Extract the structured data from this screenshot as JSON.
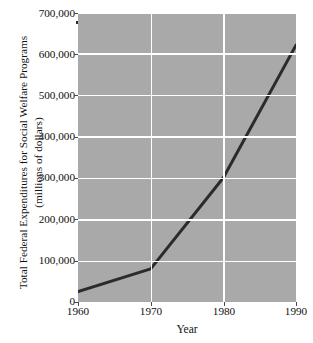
{
  "chart_data": {
    "type": "line",
    "title": "",
    "xlabel": "Year",
    "ylabel": "Total Federal Expenditures for Social Welfare Programs (millions of dollars)",
    "ylabel_line1": "Total Federal Expenditures for Social Welfare Programs",
    "ylabel_line2": "(millions of dollars)",
    "x": [
      1960,
      1970,
      1980,
      1990
    ],
    "values": [
      25000,
      80000,
      300000,
      620000
    ],
    "categories": [
      "1960",
      "1970",
      "1980",
      "1990"
    ],
    "xlim": [
      1960,
      1990
    ],
    "ylim": [
      0,
      700000
    ],
    "xticks": [
      "1960",
      "1970",
      "1980",
      "1990"
    ],
    "yticks": [
      "0",
      "100,000",
      "200,000",
      "300,000",
      "400,000",
      "500,000",
      "600,000",
      "700,000"
    ],
    "ytick_values": [
      0,
      100000,
      200000,
      300000,
      400000,
      500000,
      600000,
      700000
    ],
    "grid": true,
    "grid_color": "#ffffff",
    "legend": null,
    "panel_color": "#a9a9a9",
    "line_color": "#2b2b2b",
    "line_width": 3
  }
}
